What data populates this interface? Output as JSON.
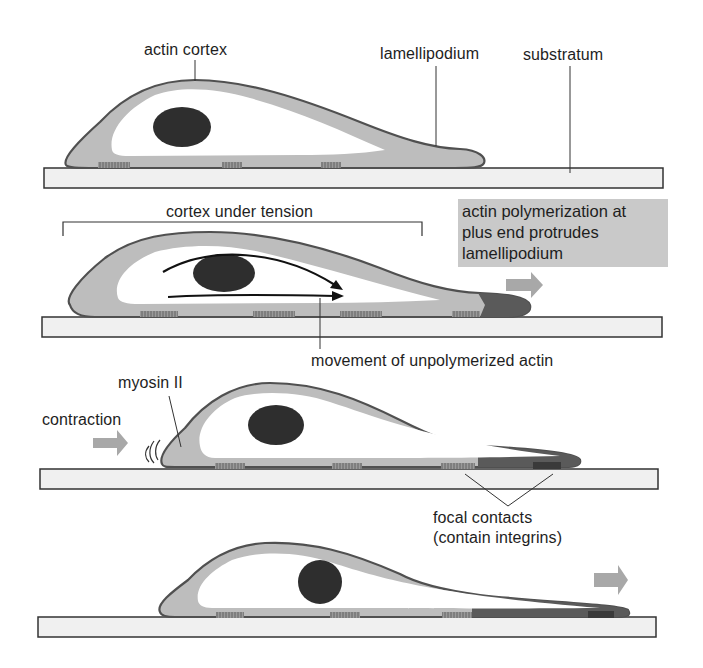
{
  "diagram": {
    "colors": {
      "cortex_fill": "#bdbdbd",
      "cortex_outline": "#505050",
      "cytoplasm": "#ffffff",
      "nucleus": "#2e2e2e",
      "new_actin": "#5a5a5a",
      "substratum_fill": "#f0f0f0",
      "substratum_outline": "#333333",
      "arrow_gray": "#a8a8a8",
      "callout_bg": "#c9c9c9",
      "text": "#1e1e1e"
    },
    "panels": [
      {
        "id": 1,
        "labels": {
          "actin_cortex": "actin cortex",
          "lamellipodium": "lamellipodium",
          "substratum": "substratum"
        }
      },
      {
        "id": 2,
        "labels": {
          "cortex_under_tension": "cortex under tension",
          "callout": [
            "actin polymerization at",
            "plus end protrudes",
            "lamellipodium"
          ],
          "movement": "movement of unpolymerized actin"
        }
      },
      {
        "id": 3,
        "labels": {
          "myosin": "myosin II",
          "contraction": "contraction",
          "focal_contacts_line1": "focal contacts",
          "focal_contacts_line2": "(contain integrins)"
        }
      },
      {
        "id": 4,
        "labels": {}
      }
    ]
  }
}
